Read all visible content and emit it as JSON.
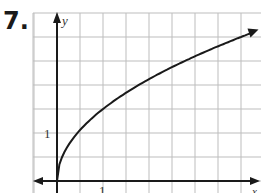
{
  "problem": {
    "number": "7."
  },
  "chart_data": {
    "type": "line",
    "title": "",
    "xlabel": "x",
    "ylabel": "y",
    "function": "y = 1.5*sqrt(x)",
    "x_tick_labels": [
      "1"
    ],
    "y_tick_labels": [
      "1"
    ],
    "grid": true,
    "grid_step": 0.5,
    "xlim": [
      -0.5,
      4.5
    ],
    "ylim": [
      -0.25,
      3.5
    ],
    "series": [
      {
        "name": "curve",
        "x": [
          0,
          0.25,
          0.5,
          1,
          1.5,
          2,
          2.5,
          3,
          3.5,
          4,
          4.25
        ],
        "y": [
          0,
          0.75,
          1.06,
          1.5,
          1.84,
          2.12,
          2.37,
          2.6,
          2.81,
          3.0,
          3.09
        ]
      }
    ],
    "arrows": {
      "x_axis": "both",
      "y_axis": "up",
      "curve_end": "arrow"
    }
  },
  "colors": {
    "grid": "#bdbdbd",
    "axis": "#1a1a1a",
    "curve": "#1a1a1a"
  }
}
